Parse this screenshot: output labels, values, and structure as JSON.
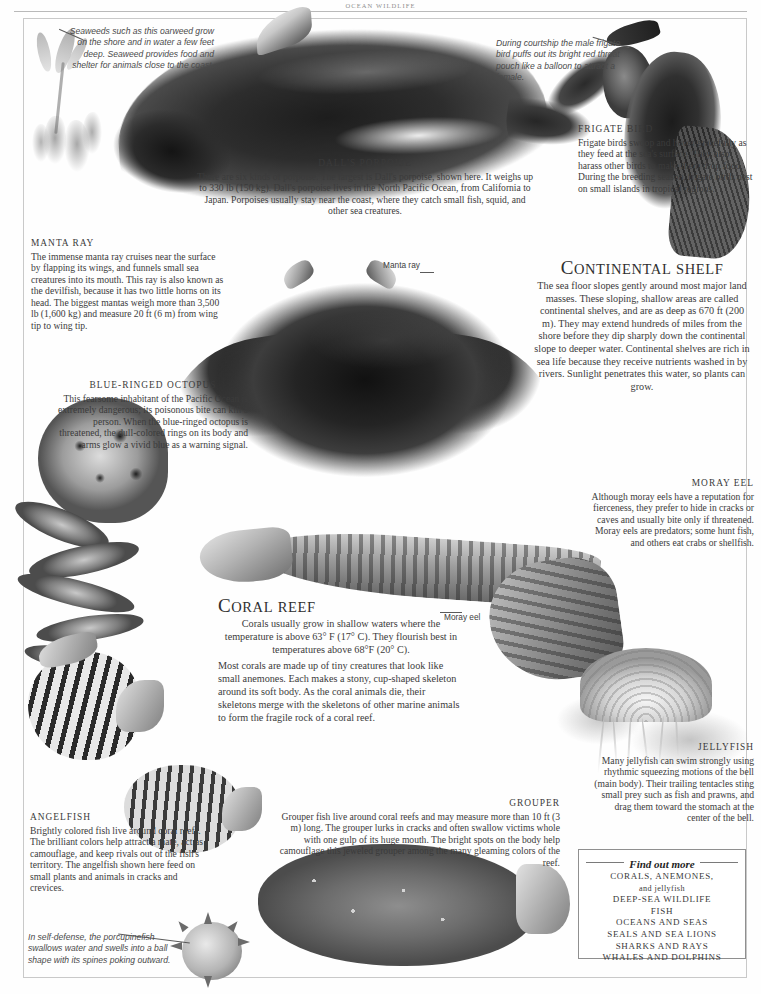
{
  "page": {
    "running_head": "OCEAN WILDLIFE"
  },
  "captions": {
    "seaweed": "Seaweeds such as this oarweed grow on the shore and in water a few feet deep. Seaweed provides food and shelter for animals close to the coast.",
    "frigate_courtship": "During courtship the male frigate bird puffs out its bright red throat pouch like a balloon to attract a female.",
    "porcupinefish": "In self-defense, the porcupinefish swallows water and swells into a ball shape with its spines poking outward."
  },
  "labels": {
    "manta_ray": "Manta ray",
    "moray_eel": "Moray eel"
  },
  "articles": {
    "dalls_porpoise": {
      "heading": "DALL'S PORPOISE",
      "body": "There are six kinds of porpoise. The largest is Dall's porpoise, shown here. It weighs up to 330 lb (150 kg). Dall's porpoise lives in the North Pacific Ocean, from California to Japan. Porpoises usually stay near the coast, where they catch small fish, squid, and other sea creatures."
    },
    "frigate_bird": {
      "heading": "FRIGATE BIRD",
      "body": "Frigate birds swoop and hover gracefully as they feed at the sea's surface. They also harass other birds to make them drop food. During the breeding season, frigate birds nest on small islands in tropical regions."
    },
    "manta_ray": {
      "heading": "MANTA RAY",
      "body": "The immense manta ray cruises near the surface by flapping its wings, and funnels small sea creatures into its mouth. This ray is also known as the devilfish, because it has two little horns on its head. The biggest mantas weigh more than 3,500 lb (1,600 kg) and measure 20 ft (6 m) from wing tip to wing tip."
    },
    "blue_ringed_octopus": {
      "heading": "BLUE-RINGED OCTOPUS",
      "body": "This fearsome inhabitant of the Pacific Ocean is extremely dangerous; its poisonous bite can kill a person. When the blue-ringed octopus is threatened, the dull-colored rings on its body and arms glow a vivid blue as a warning signal."
    },
    "continental_shelf": {
      "heading_first": "C",
      "heading_rest_big": "ONTINENTAL",
      "heading_small": "SHELF",
      "heading_plain": "CONTINENTAL SHELF",
      "body": "The sea floor slopes gently around most major land masses. These sloping, shallow areas are called continental shelves, and are as deep as 670 ft (200 m). They may extend hundreds of miles from the shore before they dip sharply down the continental slope to deeper water. Continental shelves are rich in sea life because they receive nutrients washed in by rivers. Sunlight penetrates this water, so plants can grow."
    },
    "moray_eel": {
      "heading": "MORAY EEL",
      "body": "Although moray eels have a reputation for fierceness, they prefer to hide in cracks or caves and usually bite only if threatened. Moray eels are predators; some hunt fish, and others eat crabs or shellfish."
    },
    "coral_reef": {
      "heading_first": "C",
      "heading_rest_big": "ORAL",
      "heading_small": "REEF",
      "heading_plain": "CORAL REEF",
      "body1": "Corals usually grow in shallow waters where the temperature is above 63° F (17° C). They flourish best in temperatures above 68°F (20° C).",
      "body2": "Most corals are made up of tiny creatures that look like small anemones. Each makes a stony, cup-shaped skeleton around its soft body. As the coral animals die, their skeletons merge with the skeletons of other marine animals to form the fragile rock of a coral reef."
    },
    "jellyfish": {
      "heading": "JELLYFISH",
      "body": "Many jellyfish can swim strongly using rhythmic squeezing motions of the bell (main body). Their trailing tentacles sting small prey such as fish and prawns, and drag them toward the stomach at the center of the bell."
    },
    "angelfish": {
      "heading": "ANGELFISH",
      "body": "Brightly colored fish live around coral reefs. The brilliant colors help attract a mate, act as camouflage, and keep rivals out of the fish's territory. The angelfish shown here feed on small plants and animals in cracks and crevices."
    },
    "grouper": {
      "heading": "GROUPER",
      "body": "Grouper fish live around coral reefs and may measure more than 10 ft (3 m) long. The grouper lurks in cracks and often swallow victims whole with one gulp of its huge mouth. The bright spots on the body help camouflage this jeweled grouper among the many gleaming colors of the reef."
    }
  },
  "find_out_more": {
    "title": "Find out more",
    "items": [
      {
        "main": "CORALS, ANEMONES,",
        "sub": "and jellyfish"
      },
      {
        "main": "DEEP-SEA WILDLIFE",
        "sub": ""
      },
      {
        "main": "FISH",
        "sub": ""
      },
      {
        "main": "OCEANS AND SEAS",
        "sub": ""
      },
      {
        "main": "SEALS AND SEA LIONS",
        "sub": ""
      },
      {
        "main": "SHARKS AND RAYS",
        "sub": ""
      },
      {
        "main": "WHALES AND DOLPHINS",
        "sub": ""
      }
    ]
  },
  "colors": {
    "ink": "#3b3b3b",
    "rule": "#8f8f8f",
    "frame": "#c9c9c9",
    "caption_ink": "#4a4a4a"
  }
}
